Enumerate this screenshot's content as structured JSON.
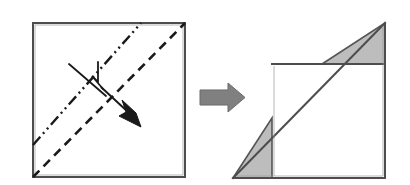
{
  "diagram": {
    "type": "origami-instruction",
    "canvas": {
      "width": 410,
      "height": 185,
      "background": "#ffffff"
    },
    "colors": {
      "outline": "#4d4d4d",
      "outline_dark": "#3a3a3a",
      "fold_line": "#1a1a1a",
      "shaded_fill": "#bdbdbd",
      "shaded_stroke": "#555555",
      "block_arrow_fill": "#808080",
      "block_arrow_stroke": "#6b6b6b",
      "arrow_fill": "#1a1a1a",
      "background": "#ffffff"
    },
    "panels": [
      {
        "name": "before-panel",
        "label": "Square sheet with fold lines",
        "shape": "square",
        "bounds": {
          "x1": 33,
          "y1": 23,
          "x2": 185,
          "y2": 177
        },
        "stroke_width": 2,
        "elements": [
          {
            "name": "mountain-fold-line",
            "label": "dash-dot-dot mountain fold reference line",
            "style": "dash-dot-dot",
            "from": [
              33,
              145
            ],
            "to": [
              141,
              23
            ],
            "dasharray": "11,4,2,4,2,4"
          },
          {
            "name": "valley-fold-line",
            "label": "dashed valley fold line (main diagonal)",
            "style": "dashed",
            "from": [
              33,
              177
            ],
            "to": [
              185,
              23
            ],
            "dasharray": "9,6"
          },
          {
            "name": "fold-arrow",
            "label": "fold direction arrow with crossed tail",
            "tail_start": [
              75,
              67
            ],
            "tail_end": [
              133,
              122
            ],
            "cross_from": [
              71,
              86
            ],
            "cross_to": [
              101,
              62
            ],
            "zigzag": [
              [
                97,
                67
              ],
              [
                95,
                83
              ],
              [
                91,
                77
              ],
              [
                101,
                88
              ]
            ]
          }
        ]
      },
      {
        "name": "transition-arrow",
        "label": "block arrow pointing right",
        "shape": "block-arrow",
        "bounds": {
          "x1": 200,
          "y1": 83,
          "x2": 245,
          "y2": 112
        }
      },
      {
        "name": "after-panel",
        "label": "Resulting folded shape with two shaded flaps",
        "elements": [
          {
            "name": "folded-body-outline",
            "label": "main folded body outline",
            "points": "272,64 385,64 385,178 233,178 272,178"
          },
          {
            "name": "main-diagonal",
            "label": "diagonal fold edge from bottom-left to top-right",
            "from": [
              233,
              178
            ],
            "to": [
              385,
              23
            ]
          },
          {
            "name": "top-shaded-flap",
            "label": "upper-right shaded triangular flap",
            "points": "385,23 385,64 322,64",
            "fill": "#bdbdbd"
          },
          {
            "name": "bottom-shaded-flap",
            "label": "lower-left shaded triangular flap",
            "points": "233,178 272,118 272,178",
            "fill": "#bdbdbd"
          },
          {
            "name": "top-right-spur",
            "label": "vertical spur up to apex",
            "from": [
              385,
              23
            ],
            "to": [
              385,
              64
            ]
          }
        ]
      }
    ]
  }
}
